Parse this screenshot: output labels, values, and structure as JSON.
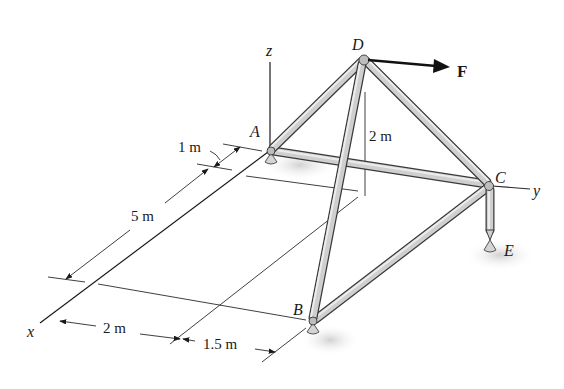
{
  "figure": {
    "type": "space truss diagram",
    "axes": {
      "x_label": "x",
      "y_label": "y",
      "z_label": "z"
    },
    "joints": [
      {
        "id": "A",
        "label": "A",
        "support": true
      },
      {
        "id": "B",
        "label": "B",
        "support": true
      },
      {
        "id": "C",
        "label": "C",
        "support": false
      },
      {
        "id": "D",
        "label": "D",
        "support": false
      },
      {
        "id": "E",
        "label": "E",
        "support": true
      }
    ],
    "members": [
      "AD",
      "AC",
      "BD",
      "BC",
      "CD",
      "CE"
    ],
    "force": {
      "label": "F",
      "applied_at": "D",
      "direction": "+y"
    },
    "dimensions": {
      "d_1m": "1 m",
      "d_5m": "5 m",
      "d_2m_height": "2 m",
      "d_2m_x": "2 m",
      "d_1_5m": "1.5 m"
    },
    "colors": {
      "member_fill": "#cfcfcf",
      "member_edge": "#3a3a3a",
      "line": "#1a1a1a",
      "shadow": "#d0d0d0"
    }
  }
}
